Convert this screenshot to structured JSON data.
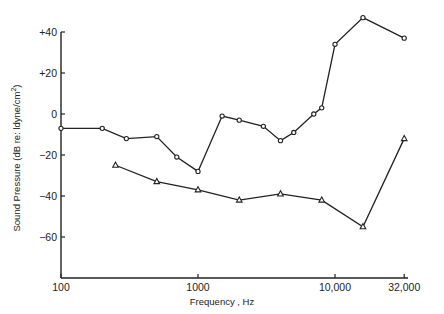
{
  "chart_data": {
    "type": "line",
    "title": "",
    "xlabel": "Frequency , Hz",
    "ylabel": "Sound Pressure (dB re: ldyne/cm2)",
    "ylabel_parts": {
      "main": "Sound Pressure (dB re: ldyne/cm",
      "sup": "2",
      "end": ")"
    },
    "x_scale": "log",
    "xlim": [
      100,
      32000
    ],
    "ylim": [
      -80,
      40
    ],
    "x_ticks": [
      {
        "value": 100,
        "label": "100"
      },
      {
        "value": 1000,
        "label": "1000"
      },
      {
        "value": 10000,
        "label": "10,000"
      },
      {
        "value": 32000,
        "label": "32,000"
      }
    ],
    "y_ticks": [
      {
        "value": 40,
        "label": "+40"
      },
      {
        "value": 20,
        "label": "+20"
      },
      {
        "value": 0,
        "label": "0"
      },
      {
        "value": -20,
        "label": "-20"
      },
      {
        "value": -40,
        "label": "-40"
      },
      {
        "value": -60,
        "label": "-60"
      }
    ],
    "grid": false,
    "legend": null,
    "series": [
      {
        "name": "circles",
        "marker": "circle",
        "x": [
          100,
          200,
          300,
          500,
          700,
          1000,
          1500,
          2000,
          3000,
          4000,
          5000,
          7000,
          8000,
          10000,
          16000,
          32000
        ],
        "values": [
          -7,
          -7,
          -12,
          -11,
          -21,
          -28,
          -1,
          -3,
          -6,
          -13,
          -9,
          0,
          3,
          34,
          47,
          37
        ]
      },
      {
        "name": "triangles",
        "marker": "triangle",
        "x": [
          250,
          500,
          1000,
          2000,
          4000,
          8000,
          16000,
          32000
        ],
        "values": [
          -25,
          -33,
          -37,
          -42,
          -39,
          -42,
          -55,
          -12
        ]
      }
    ]
  }
}
